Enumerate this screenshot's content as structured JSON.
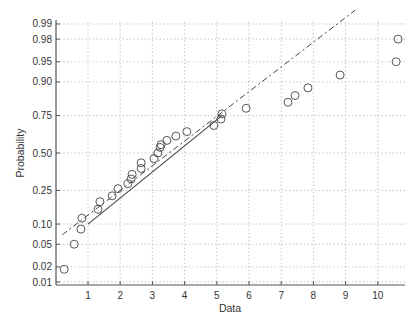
{
  "chart_data": {
    "type": "scatter",
    "subtype": "normal-probability-plot",
    "title": "",
    "xlabel": "Data",
    "ylabel": "Probability",
    "xlim": [
      0,
      10.85
    ],
    "ylim": [
      0.01,
      0.99
    ],
    "x_ticks": [
      1,
      2,
      3,
      4,
      5,
      6,
      7,
      8,
      9,
      10
    ],
    "x_tick_labels": [
      "1",
      "2",
      "3",
      "4",
      "5",
      "6",
      "7",
      "8",
      "9",
      "10"
    ],
    "y_ticks": [
      0.01,
      0.02,
      0.05,
      0.1,
      0.25,
      0.5,
      0.75,
      0.9,
      0.95,
      0.98,
      0.99
    ],
    "y_tick_labels": [
      "0.01",
      "0.02",
      "0.05",
      "0.10",
      "0.25",
      "0.50",
      "0.75",
      "0.90",
      "0.95",
      "0.98",
      "0.99"
    ],
    "grid": true,
    "legend": null,
    "marker": "open-circle",
    "points": [
      {
        "x": 0.26,
        "p": 0.018
      },
      {
        "x": 0.57,
        "p": 0.05
      },
      {
        "x": 0.78,
        "p": 0.085
      },
      {
        "x": 0.81,
        "p": 0.12
      },
      {
        "x": 1.31,
        "p": 0.155
      },
      {
        "x": 1.37,
        "p": 0.19
      },
      {
        "x": 1.75,
        "p": 0.22
      },
      {
        "x": 1.93,
        "p": 0.26
      },
      {
        "x": 2.24,
        "p": 0.29
      },
      {
        "x": 2.34,
        "p": 0.32
      },
      {
        "x": 2.37,
        "p": 0.35
      },
      {
        "x": 2.65,
        "p": 0.39
      },
      {
        "x": 2.65,
        "p": 0.43
      },
      {
        "x": 3.05,
        "p": 0.46
      },
      {
        "x": 3.17,
        "p": 0.5
      },
      {
        "x": 3.24,
        "p": 0.54
      },
      {
        "x": 3.27,
        "p": 0.56
      },
      {
        "x": 3.45,
        "p": 0.59
      },
      {
        "x": 3.73,
        "p": 0.62
      },
      {
        "x": 4.07,
        "p": 0.65
      },
      {
        "x": 4.91,
        "p": 0.69
      },
      {
        "x": 5.13,
        "p": 0.73
      },
      {
        "x": 5.16,
        "p": 0.76
      },
      {
        "x": 5.91,
        "p": 0.79
      },
      {
        "x": 7.21,
        "p": 0.82
      },
      {
        "x": 7.43,
        "p": 0.85
      },
      {
        "x": 7.83,
        "p": 0.88
      },
      {
        "x": 8.83,
        "p": 0.92
      },
      {
        "x": 10.57,
        "p": 0.95
      },
      {
        "x": 10.63,
        "p": 0.98
      }
    ],
    "reference_line": {
      "solid_segment": [
        {
          "x": 1.0,
          "p": 0.1
        },
        {
          "x": 5.16,
          "p": 0.75
        }
      ],
      "dashed_extension": [
        {
          "x": 0.2,
          "p": 0.07
        },
        {
          "x": 9.3,
          "p": 0.995
        }
      ]
    }
  },
  "colors": {
    "axis": "#555555",
    "grid": "#aaaaaa",
    "marker": "#444444",
    "line": "#444444"
  }
}
